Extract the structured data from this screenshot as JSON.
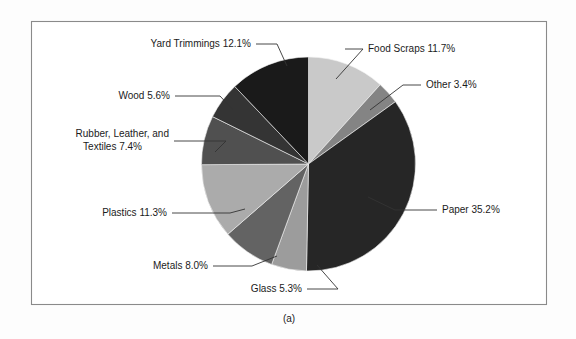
{
  "figure": {
    "caption": "(a)",
    "frame": {
      "x": 31,
      "y": 21,
      "width": 516,
      "height": 284
    }
  },
  "chart_data": {
    "type": "pie",
    "title": "",
    "subtitle": "",
    "xlabel": "",
    "ylabel": "",
    "legend_position": "none",
    "grid": false,
    "start_angle_deg": 0,
    "direction": "clockwise",
    "units": "percent",
    "total": 100.0,
    "categories": [
      "Food Scraps",
      "Other",
      "Paper",
      "Glass",
      "Metals",
      "Plastics",
      "Rubber, Leather, and Textiles",
      "Wood",
      "Yard Trimmings"
    ],
    "values": [
      11.7,
      3.4,
      35.2,
      5.3,
      8.0,
      11.3,
      7.4,
      5.6,
      12.1
    ],
    "colors": [
      "#c9c9c9",
      "#848484",
      "#262626",
      "#9c9c9c",
      "#636363",
      "#ababab",
      "#505050",
      "#343434",
      "#1a1a1a"
    ],
    "slices": [
      {
        "label": "Food Scraps",
        "value": 11.7,
        "value_text": "11.7%",
        "label_text": "Food Scraps 11.7%",
        "color": "#c9c9c9"
      },
      {
        "label": "Other",
        "value": 3.4,
        "value_text": "3.4%",
        "label_text": "Other 3.4%",
        "color": "#848484"
      },
      {
        "label": "Paper",
        "value": 35.2,
        "value_text": "35.2%",
        "label_text": "Paper 35.2%",
        "color": "#262626"
      },
      {
        "label": "Glass",
        "value": 5.3,
        "value_text": "5.3%",
        "label_text": "Glass 5.3%",
        "color": "#9c9c9c"
      },
      {
        "label": "Metals",
        "value": 8.0,
        "value_text": "8.0%",
        "label_text": "Metals 8.0%",
        "color": "#636363"
      },
      {
        "label": "Plastics",
        "value": 11.3,
        "value_text": "11.3%",
        "label_text": "Plastics 11.3%",
        "color": "#ababab"
      },
      {
        "label": "Rubber, Leather, and Textiles",
        "value": 7.4,
        "value_text": "7.4%",
        "label_text_line1": "Rubber, Leather, and",
        "label_text_line2": "Textiles 7.4%",
        "color": "#505050"
      },
      {
        "label": "Wood",
        "value": 5.6,
        "value_text": "5.6%",
        "label_text": "Wood 5.6%",
        "color": "#343434"
      },
      {
        "label": "Yard Trimmings",
        "value": 12.1,
        "value_text": "12.1%",
        "label_text": "Yard Trimmings 12.1%",
        "color": "#1a1a1a"
      }
    ]
  }
}
